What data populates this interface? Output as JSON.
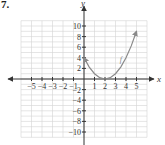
{
  "problem_number": "7.",
  "chart_data": {
    "type": "line",
    "title": "",
    "xlabel": "x",
    "ylabel": "y",
    "xlim": [
      -5,
      5
    ],
    "ylim": [
      -10,
      10
    ],
    "grid": true,
    "x_ticks": [
      -5,
      -4,
      -3,
      -2,
      -1,
      1,
      2,
      3,
      4,
      5
    ],
    "x_tick_labels": [
      "−5",
      "−4",
      "−3",
      "−2",
      "−1",
      "1",
      "2",
      "3",
      "4",
      "5"
    ],
    "y_ticks": [
      -10,
      -8,
      -6,
      -4,
      -2,
      2,
      4,
      6,
      8,
      10
    ],
    "y_tick_labels": [
      "−10",
      "−8",
      "−6",
      "−4",
      "−2",
      "2",
      "4",
      "6",
      "8",
      "10"
    ],
    "series": [
      {
        "name": "f",
        "label": "f",
        "x": [
          0,
          0.5,
          1,
          1.5,
          2,
          2.5,
          3,
          3.5,
          4,
          4.5,
          5
        ],
        "y": [
          4,
          2.25,
          1,
          0.25,
          0,
          0.25,
          1,
          2.25,
          4,
          6.25,
          9
        ],
        "arrows": [
          "start",
          "end"
        ],
        "color": "#8a8a8a"
      }
    ]
  }
}
